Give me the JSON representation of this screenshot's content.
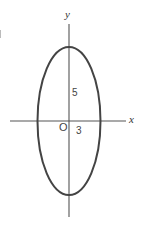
{
  "figure": {
    "type": "ellipse-plot",
    "axes": {
      "x_label": "x",
      "y_label": "y",
      "origin_label": "O"
    },
    "ellipse": {
      "center": [
        0,
        0
      ],
      "semi_axis_x": 3,
      "semi_axis_y": 5,
      "equation": "x^2/9 + y^2/25 = 1"
    },
    "annotations": {
      "semi_axis_y_label": "5",
      "semi_axis_x_label": "3"
    },
    "colors": {
      "curve": "#444444",
      "axes": "#555555",
      "text": "#333333"
    }
  }
}
